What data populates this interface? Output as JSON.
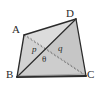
{
  "figure": {
    "kind": "geometry-diagram",
    "shape": "tetrahedron",
    "background_color": "#ffffff",
    "edge_color": "#2b2b2b",
    "dashed_edge_color": "#6b6b6b",
    "face_fill_light": "#d8d8d8",
    "face_fill_mid": "#c9c9c9",
    "face_fill_dark": "#bdbdbd",
    "label_color": "#2b2b2b"
  },
  "vertices": {
    "A": {
      "label": "A",
      "x": 24,
      "y": 35
    },
    "D": {
      "label": "D",
      "x": 76,
      "y": 19
    },
    "B": {
      "label": "B",
      "x": 17,
      "y": 77
    },
    "C": {
      "label": "C",
      "x": 86,
      "y": 76
    }
  },
  "measures": {
    "p": {
      "label": "p",
      "description": "segment-label-left"
    },
    "q": {
      "label": "q",
      "description": "segment-label-right"
    },
    "theta": {
      "label": "θ",
      "description": "angle-label-center"
    }
  },
  "edges": [
    {
      "name": "A-D",
      "style": "solid"
    },
    {
      "name": "A-B",
      "style": "solid"
    },
    {
      "name": "B-C",
      "style": "solid"
    },
    {
      "name": "C-D",
      "style": "solid"
    },
    {
      "name": "B-D",
      "style": "solid"
    },
    {
      "name": "A-C",
      "style": "dashed"
    }
  ]
}
